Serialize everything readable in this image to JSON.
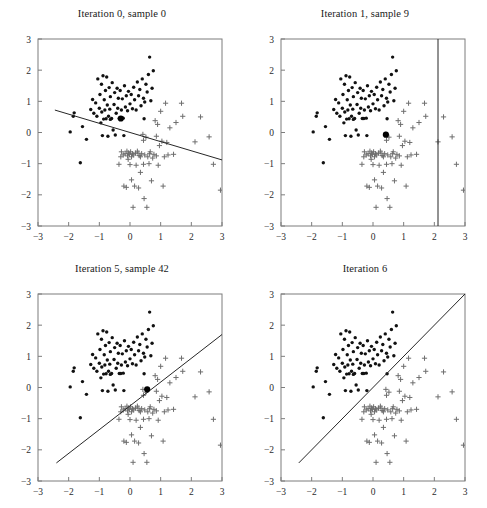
{
  "figure": {
    "type": "multi-panel-scatter",
    "width": 487,
    "height": 508,
    "background": "#ffffff",
    "rows": 2,
    "cols": 2
  },
  "style": {
    "dot_color": "#111111",
    "cross_color": "#6e6e6e",
    "line_color": "#262626",
    "axis_color": "#7d7d7d",
    "text_color": "#2b2b2b"
  },
  "axes": {
    "xlim": [
      -3,
      3
    ],
    "ylim": [
      -3,
      3
    ],
    "xticks": [
      -3,
      -2,
      -1,
      0,
      1,
      2,
      3
    ],
    "yticks": [
      -3,
      -2,
      -1,
      0,
      1,
      2,
      3
    ],
    "xtick_labels": [
      "-3",
      "-2",
      "-1",
      "0",
      "1",
      "2",
      "3"
    ],
    "ytick_labels": [
      "-3",
      "-2",
      "-1",
      "0",
      "1",
      "2",
      "3"
    ],
    "xlabel": "",
    "ylabel": "",
    "grid": false
  },
  "titles": {
    "panel1": "Iteration 0, sample 0",
    "panel2": "Iteration 1, sample 9",
    "panel3": "Iteration 5, sample 42",
    "panel4": "Iteration 6"
  },
  "chart_data": {
    "type": "scatter",
    "xlabel": "",
    "ylabel": "",
    "xlim": [
      -3,
      3
    ],
    "ylim": [
      -3,
      3
    ],
    "grid": false,
    "legend": [],
    "panels": [
      {
        "id": "panel1",
        "title": "Iteration 0, sample 0",
        "decision_line": {
          "x1": -2.45,
          "y1": 0.72,
          "x2": 3.0,
          "y2": -0.88
        },
        "highlight_point": {
          "x": -0.3,
          "y": 0.45,
          "class": "dot"
        }
      },
      {
        "id": "panel2",
        "title": "Iteration 1, sample 9",
        "decision_line": {
          "x1": 2.12,
          "y1": 3.0,
          "x2": 2.12,
          "y2": -3.0
        },
        "highlight_point": {
          "x": 0.42,
          "y": -0.07,
          "class": "dot"
        }
      },
      {
        "id": "panel3",
        "title": "Iteration 5, sample 42",
        "decision_line": {
          "x1": -2.4,
          "y1": -2.42,
          "x2": 3.0,
          "y2": 1.7
        },
        "highlight_point": {
          "x": 0.56,
          "y": -0.06,
          "class": "dot"
        }
      },
      {
        "id": "panel4",
        "title": "Iteration 6",
        "decision_line": {
          "x1": -2.42,
          "y1": -2.42,
          "x2": 3.0,
          "y2": 3.0
        },
        "highlight_point": null
      }
    ],
    "series": [
      {
        "name": "class-dot",
        "marker": "dot",
        "color": "#111111",
        "points": [
          [
            -1.95,
            0.02
          ],
          [
            -1.82,
            0.63
          ],
          [
            -1.85,
            0.52
          ],
          [
            -1.62,
            -0.97
          ],
          [
            -1.55,
            0.19
          ],
          [
            -1.42,
            -0.22
          ],
          [
            -1.28,
            0.74
          ],
          [
            -1.22,
            1.06
          ],
          [
            -1.12,
            0.95
          ],
          [
            -1.08,
            0.52
          ],
          [
            -1.05,
            1.72
          ],
          [
            -1.0,
            0.78
          ],
          [
            -0.98,
            1.22
          ],
          [
            -0.95,
            0.31
          ],
          [
            -0.93,
            1.55
          ],
          [
            -0.92,
            0.66
          ],
          [
            -0.9,
            -0.1
          ],
          [
            -0.88,
            1.82
          ],
          [
            -0.86,
            0.43
          ],
          [
            -0.84,
            1.05
          ],
          [
            -0.82,
            0.72
          ],
          [
            -0.8,
            1.35
          ],
          [
            -0.78,
            0.44
          ],
          [
            -0.76,
            1.78
          ],
          [
            -0.74,
            0.88
          ],
          [
            -0.72,
            -0.12
          ],
          [
            -0.7,
            0.52
          ],
          [
            -0.68,
            1.44
          ],
          [
            -0.66,
            0.75
          ],
          [
            -0.64,
            1.15
          ],
          [
            -0.6,
            0.45
          ],
          [
            -0.58,
            1.6
          ],
          [
            -0.55,
            0.08
          ],
          [
            -0.52,
            0.9
          ],
          [
            -0.5,
            1.28
          ],
          [
            -0.48,
            -0.08
          ],
          [
            -0.45,
            0.62
          ],
          [
            -0.42,
            1.42
          ],
          [
            -0.4,
            0.78
          ],
          [
            -0.38,
            1.1
          ],
          [
            -0.35,
            0.45
          ],
          [
            -0.32,
            1.35
          ],
          [
            -0.3,
            0.45
          ],
          [
            -0.28,
            0.72
          ],
          [
            -0.25,
            1.08
          ],
          [
            -0.22,
            0.46
          ],
          [
            -0.2,
            -0.1
          ],
          [
            -0.18,
            1.5
          ],
          [
            -0.15,
            0.82
          ],
          [
            -0.12,
            1.18
          ],
          [
            -0.08,
            0.7
          ],
          [
            -0.05,
            1.32
          ],
          [
            0.0,
            0.92
          ],
          [
            0.04,
            1.22
          ],
          [
            0.08,
            0.76
          ],
          [
            0.12,
            1.45
          ],
          [
            0.15,
            1.05
          ],
          [
            0.2,
            0.72
          ],
          [
            0.24,
            1.62
          ],
          [
            0.28,
            1.18
          ],
          [
            0.32,
            1.38
          ],
          [
            0.36,
            0.86
          ],
          [
            0.4,
            1.72
          ],
          [
            0.44,
            1.1
          ],
          [
            0.48,
            0.98
          ],
          [
            0.52,
            1.55
          ],
          [
            0.56,
            1.3
          ],
          [
            0.6,
            1.86
          ],
          [
            0.64,
            2.42
          ],
          [
            0.68,
            1.02
          ],
          [
            0.72,
            1.42
          ],
          [
            0.76,
            1.98
          ],
          [
            0.46,
            0.44
          ],
          [
            -0.64,
            0.42
          ],
          [
            -1.18,
            0.62
          ]
        ]
      },
      {
        "name": "class-cross",
        "marker": "plus",
        "color": "#6e6e6e",
        "points": [
          [
            -0.36,
            -1.02
          ],
          [
            -0.28,
            -0.62
          ],
          [
            -0.22,
            -0.72
          ],
          [
            -0.2,
            -1.72
          ],
          [
            -0.16,
            -0.68
          ],
          [
            -0.12,
            -1.76
          ],
          [
            -0.1,
            -0.6
          ],
          [
            -0.08,
            -0.75
          ],
          [
            -0.05,
            -0.66
          ],
          [
            -0.02,
            -0.7
          ],
          [
            0.0,
            -1.03
          ],
          [
            0.02,
            -0.62
          ],
          [
            0.05,
            -0.78
          ],
          [
            0.08,
            -0.68
          ],
          [
            0.1,
            -2.4
          ],
          [
            0.12,
            -0.72
          ],
          [
            0.15,
            -1.72
          ],
          [
            0.18,
            -0.66
          ],
          [
            0.2,
            -1.05
          ],
          [
            0.24,
            -0.6
          ],
          [
            0.28,
            -1.78
          ],
          [
            0.3,
            -0.74
          ],
          [
            0.34,
            -1.28
          ],
          [
            0.38,
            -0.68
          ],
          [
            0.42,
            -0.06
          ],
          [
            0.44,
            -1.02
          ],
          [
            0.46,
            -2.12
          ],
          [
            0.48,
            -0.72
          ],
          [
            0.52,
            -0.15
          ],
          [
            0.55,
            -2.4
          ],
          [
            0.58,
            -0.78
          ],
          [
            0.62,
            -1.0
          ],
          [
            0.66,
            -0.62
          ],
          [
            0.7,
            -1.55
          ],
          [
            0.74,
            -0.82
          ],
          [
            0.78,
            -0.7
          ],
          [
            0.82,
            0.38
          ],
          [
            0.86,
            -0.75
          ],
          [
            0.9,
            0.26
          ],
          [
            0.92,
            -1.05
          ],
          [
            0.96,
            -0.42
          ],
          [
            1.0,
            0.68
          ],
          [
            1.04,
            -0.28
          ],
          [
            1.08,
            -1.72
          ],
          [
            1.12,
            -0.78
          ],
          [
            1.16,
            0.94
          ],
          [
            1.2,
            -0.32
          ],
          [
            1.3,
            0.15
          ],
          [
            1.42,
            -0.7
          ],
          [
            1.5,
            0.32
          ],
          [
            1.68,
            0.94
          ],
          [
            1.72,
            0.52
          ],
          [
            2.12,
            -0.3
          ],
          [
            2.3,
            0.5
          ],
          [
            2.58,
            -0.14
          ],
          [
            2.72,
            -1.02
          ],
          [
            2.95,
            -1.85
          ],
          [
            0.26,
            -0.66
          ],
          [
            -0.3,
            -0.78
          ],
          [
            0.05,
            -1.52
          ],
          [
            -0.06,
            -0.86
          ],
          [
            0.64,
            -0.68
          ],
          [
            0.34,
            -0.78
          ],
          [
            1.24,
            -0.72
          ],
          [
            0.86,
            -0.12
          ],
          [
            0.44,
            -0.25
          ]
        ]
      }
    ]
  }
}
